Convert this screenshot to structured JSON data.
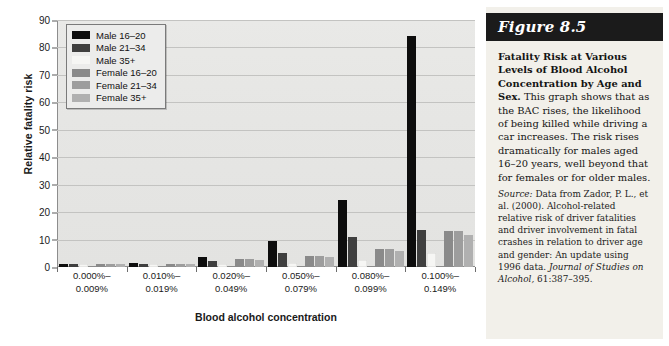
{
  "figure": {
    "banner_label": "Figure 8.5",
    "caption_title": "Fatality Risk at Various Levels of Blood Alcohol Concentration by Age and Sex.",
    "caption_body": " This graph shows that as the BAC rises, the likelihood of being killed while driving a car increases. The risk rises dramatically for males aged 16–20 years, well beyond that for females or for older males.",
    "source_label": "Source:",
    "source_body": " Data from Zador, P. L., et al. (2000). Alcohol-related relative risk of driver fatalities and driver involvement in fatal crashes in relation to driver age and gender: An update using 1996 data. ",
    "source_journal": "Journal of Studies on Alcohol,",
    "source_citation": " 61:387–395."
  },
  "colors": {
    "banner_background": "#1b1b1b",
    "panel_background": "#f2f0ea",
    "plot_background": "#e6e6e4",
    "gridline": "#c3c3c1",
    "axis": "#8d8d8d",
    "series": [
      "#0d0d0d",
      "#3f3f3f",
      "#f6f6f4",
      "#8a8a8a",
      "#9d9d9d",
      "#b0b0b0"
    ]
  },
  "chart_data": {
    "type": "bar",
    "title": "",
    "xlabel": "Blood alcohol concentration",
    "ylabel": "Relative fatality risk",
    "ylim": [
      0,
      90
    ],
    "yticks": [
      0,
      10,
      20,
      30,
      40,
      50,
      60,
      70,
      80,
      90
    ],
    "grid": true,
    "legend_position": "top-left",
    "categories": [
      "0.000%–\n0.009%",
      "0.010%–\n0.019%",
      "0.020%–\n0.049%",
      "0.050%–\n0.079%",
      "0.080%–\n0.099%",
      "0.100%–\n0.149%"
    ],
    "category_lines": [
      [
        "0.000%–",
        "0.009%"
      ],
      [
        "0.010%–",
        "0.019%"
      ],
      [
        "0.020%–",
        "0.049%"
      ],
      [
        "0.050%–",
        "0.079%"
      ],
      [
        "0.080%–",
        "0.099%"
      ],
      [
        "0.100%–",
        "0.149%"
      ]
    ],
    "series": [
      {
        "name": "Male 16–20",
        "color": "#0d0d0d",
        "values": [
          1.0,
          1.6,
          3.6,
          9.5,
          24.5,
          84.0
        ]
      },
      {
        "name": "Male 21–34",
        "color": "#3f3f3f",
        "values": [
          1.0,
          1.0,
          2.1,
          5.0,
          11.0,
          13.5
        ]
      },
      {
        "name": "Male 35+",
        "color": "#f6f6f4",
        "values": [
          1.0,
          1.0,
          1.2,
          1.6,
          2.5,
          5.0
        ]
      },
      {
        "name": "Female 16–20",
        "color": "#8a8a8a",
        "values": [
          1.0,
          1.0,
          3.0,
          4.0,
          6.5,
          13.0
        ]
      },
      {
        "name": "Female 21–34",
        "color": "#9d9d9d",
        "values": [
          1.0,
          1.0,
          3.0,
          4.0,
          6.5,
          13.0
        ]
      },
      {
        "name": "Female 35+",
        "color": "#b0b0b0",
        "values": [
          1.0,
          1.0,
          2.6,
          3.6,
          6.0,
          11.5
        ]
      }
    ]
  }
}
